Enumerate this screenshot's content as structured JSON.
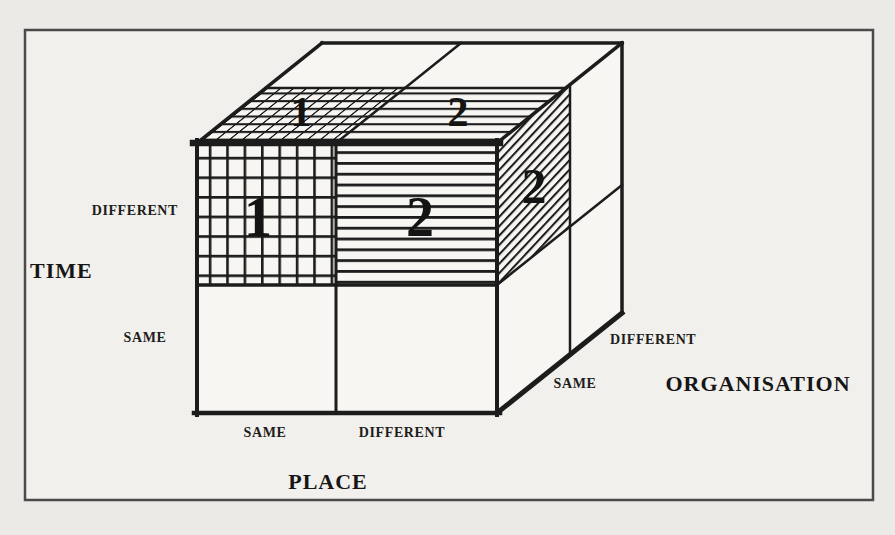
{
  "figure_type": "3d-cube-taxonomy-diagram",
  "colors": {
    "page_background": "#e7e6e2",
    "paper": "#f1f0ec",
    "face": "#f7f6f2",
    "ink": "#1c1c1c"
  },
  "axes": {
    "time": {
      "title": "TIME",
      "top": "DIFFERENT",
      "bottom": "SAME"
    },
    "place": {
      "title": "PLACE",
      "left": "SAME",
      "right": "DIFFERENT"
    },
    "organisation": {
      "title": "ORGANISATION",
      "front": "SAME",
      "back": "DIFFERENT"
    }
  },
  "cube_numbers": {
    "front_top_left": "1",
    "front_top_right": "2",
    "top_front_left": "1",
    "top_front_right": "2",
    "side_top_front": "2"
  },
  "cell_patterns": {
    "front_top_left": "square-grid",
    "front_top_right": "horizontal-lines",
    "front_bottom_left": "blank",
    "front_bottom_right": "blank",
    "top_front_left": "foreshortened-grid",
    "top_front_right": "horizontal-lines",
    "top_back": "blank",
    "side_top_front": "diagonal-hatch",
    "side_other": "blank"
  }
}
